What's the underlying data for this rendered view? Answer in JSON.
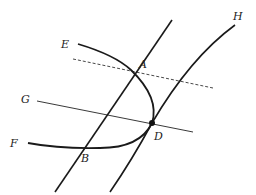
{
  "diagram": {
    "type": "geometry",
    "labels": {
      "E": "E",
      "A": "A",
      "H": "H",
      "G": "G",
      "F": "F",
      "B": "B",
      "D": "D"
    },
    "elements": [
      {
        "name": "curve-EF",
        "description": "parabola-like curve from E through A, D, B to F"
      },
      {
        "name": "line-AB",
        "description": "straight line through A and B"
      },
      {
        "name": "curve-H",
        "description": "curve through D ending at H"
      },
      {
        "name": "line-G",
        "description": "thin line from G through D"
      },
      {
        "name": "dashed-line-A",
        "description": "dashed line through A"
      }
    ],
    "points": {
      "A": [
        131,
        70
      ],
      "B": [
        79,
        148
      ],
      "D": [
        152,
        123
      ]
    },
    "colors": {
      "stroke": "#1a1a1a",
      "background": "#ffffff"
    }
  }
}
